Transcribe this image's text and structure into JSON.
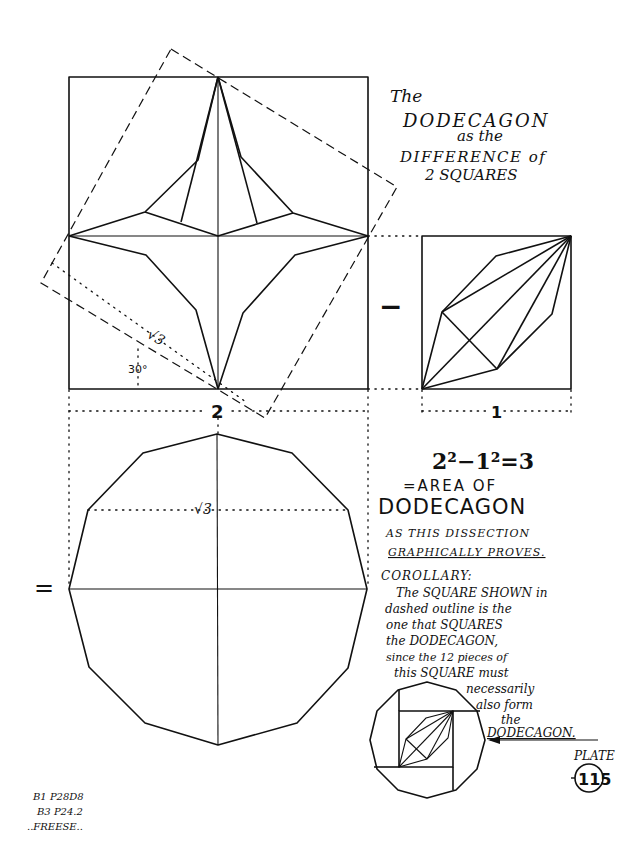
{
  "title": {
    "line1": "The",
    "line2": "DODECAGON",
    "line3": "as the",
    "line4": "DIFFERENCE of",
    "line5": "2 SQUARES"
  },
  "figure_labels": {
    "sqrt3_big_square": "√3",
    "angle": "30°",
    "dimension_big": "2",
    "dimension_small": "1",
    "minus_sign": "−",
    "equals_sign": "=",
    "sqrt3_dodecagon": "√3"
  },
  "equation": {
    "formula": "2²−1²=3",
    "line1": "=AREA OF",
    "line2": "DODECAGON"
  },
  "proof_note": {
    "line1": "AS THIS DISSECTION",
    "line2": "GRAPHICALLY PROVES."
  },
  "corollary": {
    "heading": "COROLLARY:",
    "lines": [
      "The SQUARE SHOWN in",
      "dashed outline is the",
      "one that SQUARES",
      "the DODECAGON,",
      "since the 12 pieces of",
      "this SQUARE must",
      "necessarily",
      "also form",
      "the",
      "DODECAGON."
    ]
  },
  "plate": {
    "label": "PLATE",
    "number": "115"
  },
  "reference": {
    "line1": "B1 P28D8",
    "line2": "B3 P24.2",
    "line3": "..FREESE.."
  },
  "colors": {
    "ink": "#111111",
    "paper": "#ffffff"
  }
}
